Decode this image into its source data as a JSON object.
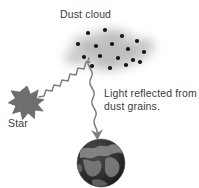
{
  "diagram": {
    "title": "Dust cloud",
    "background_color": "#ffffff",
    "labels": {
      "dust_cloud": "Dust cloud",
      "star": "Star",
      "reflected_line1": "Light reflected from",
      "reflected_line2": "dust grains."
    },
    "colors": {
      "text": "#3b3b3b",
      "star_fill": "#6e6e6e",
      "star_stroke": "#4a4a4a",
      "cloud_fill": "#b4b4b4",
      "dust_grain": "#141414",
      "ray": "#7a7a7a",
      "planet_ocean": "#2a2a2a",
      "planet_land": "#868686"
    },
    "elements": {
      "star": {
        "name": "star",
        "center_x": 27,
        "center_y": 103,
        "outer_radius": 17,
        "inner_radius": 8,
        "points": 10
      },
      "dust_cloud": {
        "name": "dust-cloud",
        "center_x": 110,
        "center_y": 52,
        "width": 100,
        "height": 52
      },
      "dust_grains": [
        {
          "x": 88,
          "y": 33
        },
        {
          "x": 105,
          "y": 30
        },
        {
          "x": 122,
          "y": 36
        },
        {
          "x": 137,
          "y": 41
        },
        {
          "x": 78,
          "y": 44
        },
        {
          "x": 96,
          "y": 46
        },
        {
          "x": 112,
          "y": 44
        },
        {
          "x": 128,
          "y": 49
        },
        {
          "x": 144,
          "y": 52
        },
        {
          "x": 84,
          "y": 57
        },
        {
          "x": 100,
          "y": 56
        },
        {
          "x": 118,
          "y": 58
        },
        {
          "x": 133,
          "y": 60
        },
        {
          "x": 92,
          "y": 66
        },
        {
          "x": 110,
          "y": 68
        },
        {
          "x": 126,
          "y": 65
        },
        {
          "x": 140,
          "y": 62
        }
      ],
      "incoming_ray": {
        "name": "incoming-light-ray",
        "from_x": 40,
        "from_y": 96,
        "to_x": 86,
        "to_y": 52,
        "style": "zigzag"
      },
      "reflected_ray": {
        "name": "reflected-light-ray",
        "from_x": 92,
        "from_y": 62,
        "to_x": 98,
        "to_y": 140,
        "style": "sine-wave",
        "arrowhead": true
      },
      "planet": {
        "name": "planet-earth",
        "center_x": 101,
        "center_y": 163,
        "radius": 24
      }
    }
  }
}
